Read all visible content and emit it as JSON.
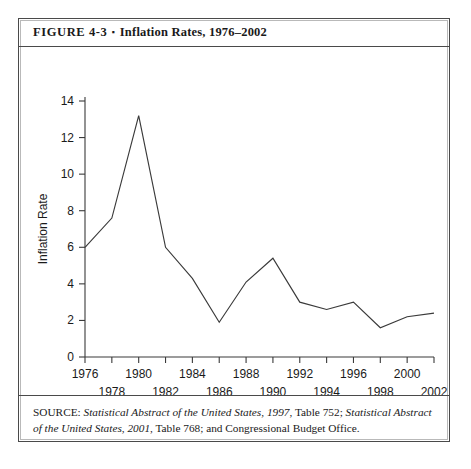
{
  "figure": {
    "label": "FIGURE  4-3",
    "bullet": "▪",
    "title": "Inflation Rates, 1976–2002",
    "caption_full": "FIGURE  4-3 ▪ Inflation Rates, 1976–2002"
  },
  "source": {
    "prefix": "SOURCE: ",
    "part1_italic": "Statistical Abstract of the United States, 1997",
    "part2": ", Table 752; ",
    "part3_italic": "Statistical Abstract of the United States, 2001",
    "part4": ", Table 768; and Congressional Budget Office.",
    "full_text": "SOURCE: Statistical Abstract of the United States, 1997, Table 752; Statistical Abstract of the United States, 2001, Table 768; and Congressional Budget Office."
  },
  "colors": {
    "line": "#3a3a3a",
    "axis": "#3a3a3a",
    "frame_outer": "#4a4a4a",
    "frame_inner": "#b9b9b9",
    "text": "#1a1a1a",
    "background": "#ffffff"
  },
  "chart_data": {
    "type": "line",
    "title": "Inflation Rates, 1976–2002",
    "xlabel": "Year",
    "ylabel": "Inflation Rate",
    "xlim": [
      1976,
      2002
    ],
    "ylim": [
      0,
      14
    ],
    "grid": false,
    "legend": "none",
    "yticks": [
      0,
      2,
      4,
      6,
      8,
      10,
      12,
      14
    ],
    "ytick_labels": [
      "0",
      "2",
      "4",
      "6",
      "8",
      "10",
      "12",
      "14"
    ],
    "xticks": [
      1976,
      1978,
      1980,
      1982,
      1984,
      1986,
      1988,
      1990,
      1992,
      1994,
      1996,
      1998,
      2000,
      2002
    ],
    "xtick_labels_upper": [
      "1976",
      "1980",
      "1984",
      "1988",
      "1992",
      "1996",
      "2000"
    ],
    "xtick_labels_lower": [
      "1978",
      "1982",
      "1986",
      "1990",
      "1994",
      "1998",
      "2002"
    ],
    "x": [
      1976,
      1978,
      1980,
      1982,
      1984,
      1986,
      1988,
      1990,
      1992,
      1994,
      1996,
      1998,
      2000,
      2002
    ],
    "values": [
      6.0,
      7.6,
      13.2,
      6.0,
      4.3,
      1.9,
      4.1,
      5.4,
      3.0,
      2.6,
      3.0,
      1.6,
      2.2,
      2.4
    ],
    "series": [
      {
        "name": "Inflation Rate",
        "values": [
          6.0,
          7.6,
          13.2,
          6.0,
          4.3,
          1.9,
          4.1,
          5.4,
          3.0,
          2.6,
          3.0,
          1.6,
          2.2,
          2.4
        ]
      }
    ]
  }
}
